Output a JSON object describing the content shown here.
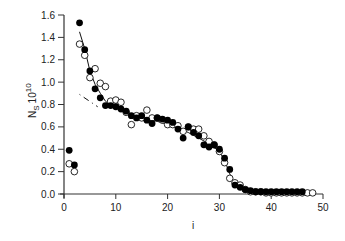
{
  "chart_data": {
    "type": "scatter",
    "title": "",
    "xlabel": "i",
    "ylabel": "N_S 10^10",
    "ylabel_parts": {
      "main": "N",
      "sub": "S",
      "base": "10",
      "sup": "10"
    },
    "xlim": [
      0,
      50
    ],
    "ylim": [
      0.0,
      1.6
    ],
    "xticks": [
      0,
      10,
      20,
      30,
      40,
      50
    ],
    "yticks": [
      0.0,
      0.2,
      0.4,
      0.6,
      0.8,
      1.0,
      1.2,
      1.4,
      1.6
    ],
    "ytick_labels": [
      "0.0",
      "0.2",
      "0.4",
      "0.6",
      "0.8",
      "1.0",
      "1.2",
      "1.4",
      "1.6"
    ],
    "grid": false,
    "legend": null,
    "series": [
      {
        "name": "filled circles",
        "marker": "filled-circle",
        "color": "#000000",
        "x": [
          1,
          2,
          3,
          4,
          5,
          6,
          7,
          8,
          9,
          10,
          11,
          12,
          13,
          14,
          15,
          16,
          17,
          18,
          19,
          20,
          21,
          22,
          23,
          24,
          25,
          26,
          27,
          28,
          29,
          30,
          31,
          32,
          33,
          34,
          35,
          36,
          37,
          38,
          39,
          40,
          41,
          42,
          43,
          44,
          45,
          46
        ],
        "y": [
          0.39,
          0.26,
          1.53,
          1.29,
          1.1,
          0.94,
          0.86,
          0.79,
          0.79,
          0.78,
          0.76,
          0.74,
          0.7,
          0.68,
          0.7,
          0.66,
          0.63,
          0.68,
          0.67,
          0.66,
          0.64,
          0.58,
          0.5,
          0.6,
          0.55,
          0.52,
          0.44,
          0.42,
          0.44,
          0.4,
          0.32,
          0.22,
          0.08,
          0.06,
          0.04,
          0.03,
          0.02,
          0.02,
          0.02,
          0.02,
          0.02,
          0.02,
          0.02,
          0.02,
          0.02,
          0.02
        ]
      },
      {
        "name": "open circles",
        "marker": "open-circle",
        "color": "#000000",
        "x": [
          1,
          2,
          3,
          4,
          5,
          6,
          7,
          8,
          9,
          10,
          11,
          12,
          13,
          14,
          15,
          16,
          17,
          18,
          19,
          20,
          21,
          22,
          23,
          24,
          25,
          26,
          27,
          28,
          29,
          30,
          31,
          32,
          33,
          34,
          35,
          36,
          37,
          38,
          39,
          40,
          41,
          42,
          43,
          44,
          45,
          46,
          47,
          48
        ],
        "y": [
          0.27,
          0.2,
          1.34,
          1.24,
          1.04,
          1.12,
          0.99,
          0.96,
          0.83,
          0.84,
          0.82,
          0.73,
          0.62,
          0.7,
          0.68,
          0.75,
          0.68,
          0.68,
          0.66,
          0.62,
          0.62,
          0.61,
          0.56,
          0.6,
          0.58,
          0.58,
          0.52,
          0.47,
          0.44,
          0.38,
          0.28,
          0.14,
          0.1,
          0.08,
          0.04,
          0.02,
          0.02,
          0.02,
          0.01,
          0.01,
          0.01,
          0.01,
          0.01,
          0.01,
          0.01,
          0.01,
          0.01,
          0.01
        ]
      },
      {
        "name": "fit curve",
        "marker": "line",
        "color": "#000000",
        "x": [
          3,
          4,
          5,
          6,
          7,
          8,
          9,
          10,
          12,
          14,
          16,
          18,
          20,
          22,
          24,
          26,
          28,
          30,
          31,
          32,
          33,
          34,
          35,
          36,
          38,
          40,
          44,
          48
        ],
        "y": [
          1.45,
          1.3,
          1.1,
          0.98,
          0.9,
          0.83,
          0.79,
          0.77,
          0.73,
          0.7,
          0.67,
          0.65,
          0.62,
          0.59,
          0.55,
          0.5,
          0.45,
          0.38,
          0.3,
          0.18,
          0.09,
          0.05,
          0.03,
          0.02,
          0.01,
          0.01,
          0.01,
          0.01
        ]
      },
      {
        "name": "dashed segment",
        "marker": "dashed-line",
        "color": "#000000",
        "x": [
          3.0,
          6.5
        ],
        "y": [
          0.89,
          0.78
        ]
      }
    ]
  }
}
